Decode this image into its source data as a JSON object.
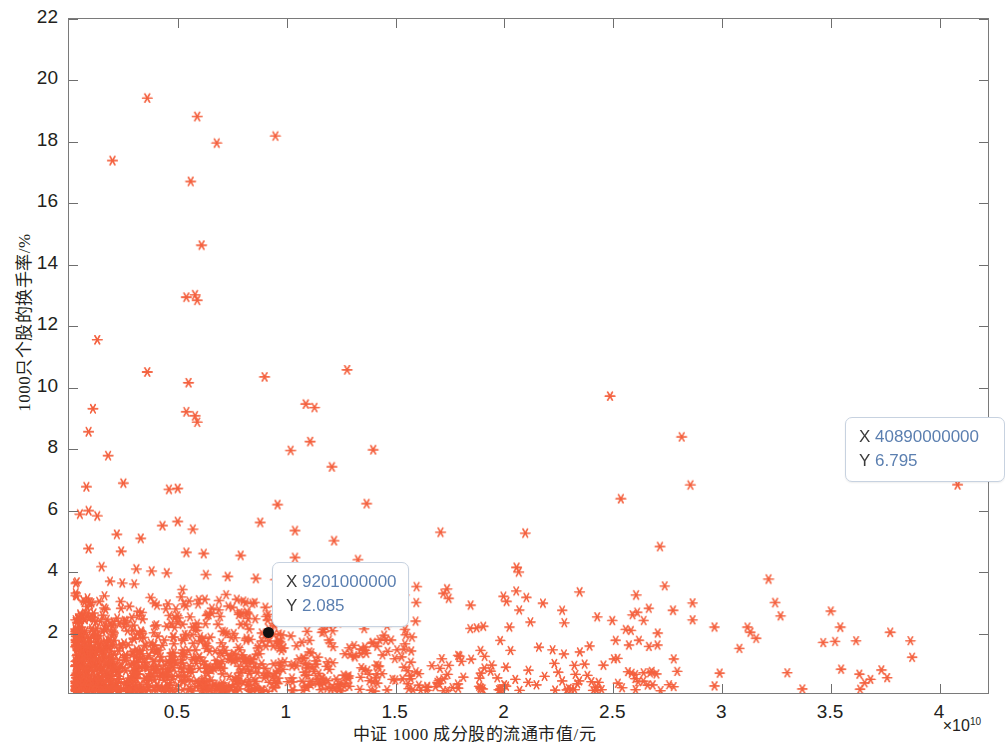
{
  "chart_data": {
    "type": "scatter",
    "title": "",
    "xlabel": "中证 1000 成分股的流通市值/元",
    "ylabel": "1000只个股的换手率/%",
    "x_exponent_label": "×10",
    "x_exponent_power": "10",
    "x_multiplier": 10000000000.0,
    "xlim": [
      0,
      4.23
    ],
    "ylim": [
      0,
      22
    ],
    "xticks": [
      0.5,
      1,
      1.5,
      2,
      2.5,
      3,
      3.5,
      4
    ],
    "xtick_labels": [
      "0.5",
      "1",
      "1.5",
      "2",
      "2.5",
      "3",
      "3.5",
      "4"
    ],
    "yticks": [
      2,
      4,
      6,
      8,
      10,
      12,
      14,
      16,
      18,
      20,
      22
    ],
    "ytick_labels": [
      "2",
      "4",
      "6",
      "8",
      "10",
      "12",
      "14",
      "16",
      "18",
      "20",
      "22"
    ],
    "grid": false,
    "legend": null,
    "marker": "asterisk",
    "marker_color": "#F4603E",
    "marker_size": 9,
    "axis_color": "#7a7a7a",
    "series": [
      {
        "name": "中证1000成分股",
        "points": [
          [
            0.36,
            19.42
          ],
          [
            0.59,
            18.82
          ],
          [
            0.95,
            18.18
          ],
          [
            0.68,
            17.95
          ],
          [
            0.2,
            17.38
          ],
          [
            0.56,
            16.7
          ],
          [
            0.61,
            14.62
          ],
          [
            0.54,
            12.92
          ],
          [
            0.58,
            13.0
          ],
          [
            0.59,
            12.82
          ],
          [
            0.13,
            11.53
          ],
          [
            1.28,
            10.55
          ],
          [
            0.36,
            10.48
          ],
          [
            0.9,
            10.32
          ],
          [
            0.55,
            10.13
          ],
          [
            1.09,
            9.43
          ],
          [
            1.13,
            9.32
          ],
          [
            2.49,
            9.69
          ],
          [
            0.54,
            9.18
          ],
          [
            0.58,
            9.05
          ],
          [
            0.11,
            9.28
          ],
          [
            0.59,
            8.84
          ],
          [
            0.09,
            8.53
          ],
          [
            2.82,
            8.36
          ],
          [
            1.11,
            8.21
          ],
          [
            1.02,
            7.92
          ],
          [
            1.4,
            7.94
          ],
          [
            0.18,
            7.75
          ],
          [
            1.21,
            7.38
          ],
          [
            0.25,
            6.85
          ],
          [
            0.08,
            6.73
          ],
          [
            0.5,
            6.68
          ],
          [
            0.46,
            6.65
          ],
          [
            2.86,
            6.79
          ],
          [
            0.96,
            6.15
          ],
          [
            1.37,
            6.18
          ],
          [
            2.54,
            6.34
          ],
          [
            0.09,
            5.95
          ],
          [
            0.05,
            5.84
          ],
          [
            0.13,
            5.78
          ],
          [
            0.5,
            5.6
          ],
          [
            0.88,
            5.57
          ],
          [
            0.43,
            5.46
          ],
          [
            0.57,
            5.35
          ],
          [
            1.04,
            5.3
          ],
          [
            1.71,
            5.25
          ],
          [
            2.1,
            5.22
          ],
          [
            0.22,
            5.18
          ],
          [
            0.33,
            5.05
          ],
          [
            1.22,
            4.97
          ],
          [
            2.72,
            4.78
          ],
          [
            0.09,
            4.71
          ],
          [
            0.24,
            4.63
          ],
          [
            0.54,
            4.59
          ],
          [
            0.62,
            4.55
          ],
          [
            0.79,
            4.49
          ],
          [
            1.04,
            4.42
          ],
          [
            1.33,
            4.35
          ],
          [
            2.06,
            4.1
          ],
          [
            2.07,
            3.95
          ],
          [
            0.15,
            4.12
          ],
          [
            0.31,
            4.05
          ],
          [
            0.38,
            3.98
          ],
          [
            0.45,
            3.92
          ],
          [
            0.63,
            3.86
          ],
          [
            0.73,
            3.8
          ],
          [
            0.86,
            3.74
          ],
          [
            0.95,
            3.7
          ],
          [
            1.1,
            3.63
          ],
          [
            1.21,
            3.58
          ],
          [
            1.45,
            3.52
          ],
          [
            1.6,
            3.47
          ],
          [
            1.74,
            3.4
          ],
          [
            2.35,
            3.3
          ],
          [
            2.61,
            3.2
          ],
          [
            3.22,
            3.72
          ],
          [
            3.25,
            2.95
          ],
          [
            3.55,
            2.15
          ],
          [
            3.78,
            1.98
          ],
          [
            2.78,
            2.7
          ],
          [
            0.92,
            2.085
          ],
          [
            4.09,
            6.795
          ]
        ]
      }
    ],
    "dense_cluster": {
      "description": "Very dense cloud of points concentrated in lower-left region",
      "x_range": [
        0.03,
        1.45
      ],
      "y_range": [
        0.05,
        3.2
      ],
      "approximate_count": 820,
      "peak_x": 0.45,
      "peak_y": 1.2
    },
    "total_points": 1000,
    "datatips": [
      {
        "id": "datatip-1",
        "x_label": "X",
        "x_value": "9201000000",
        "y_label": "Y",
        "y_value": "2.085",
        "marker_x": 0.92,
        "marker_y": 2.085,
        "box_left_px": 272,
        "box_top_px": 562,
        "dot_left_px": 263,
        "dot_top_px": 627
      },
      {
        "id": "datatip-2",
        "x_label": "X",
        "x_value": "40890000000",
        "y_label": "Y",
        "y_value": "6.795",
        "marker_x": 4.089,
        "marker_y": 6.795,
        "box_left_px": 845,
        "box_top_px": 417,
        "dot_left_px": null,
        "dot_top_px": null
      }
    ]
  }
}
